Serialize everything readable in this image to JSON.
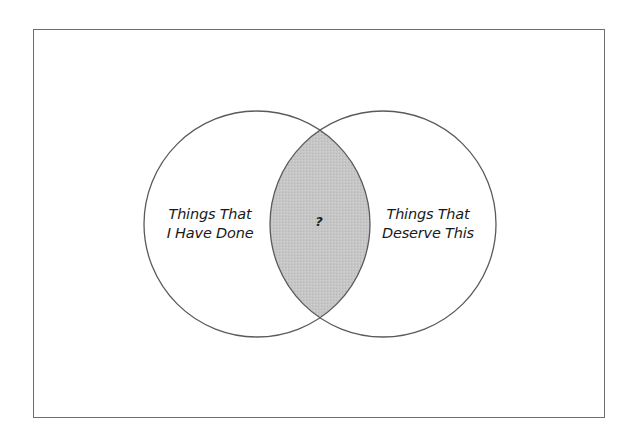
{
  "diagram": {
    "type": "venn",
    "sets": [
      {
        "id": "left",
        "lines": [
          "Things That",
          "I Have Done"
        ]
      },
      {
        "id": "right",
        "lines": [
          "Things That",
          "Deserve This"
        ]
      }
    ],
    "intersection": {
      "label": "?",
      "fill": "#c4c4c4"
    },
    "colors": {
      "stroke": "#5a5a5a",
      "background": "#ffffff",
      "frame": "#6e6e6e"
    }
  }
}
